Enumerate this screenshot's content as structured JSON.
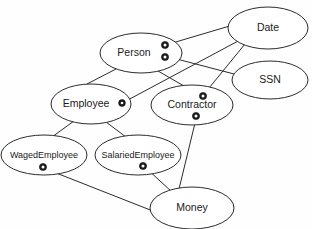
{
  "diagram": {
    "type": "uml-ellipse-graph",
    "background_color": "#fefefe",
    "stroke_color": "#2b2b2b",
    "label_color": "#1a1a1a",
    "marker_fill": "#1c1c1c",
    "marker_hole": "#fdfdfd",
    "nodes": [
      {
        "id": "person",
        "label": "Person",
        "cx": 141,
        "cy": 53,
        "rx": 41,
        "ry": 20,
        "font_size": 10.5,
        "label_dx": -7
      },
      {
        "id": "date",
        "label": "Date",
        "cx": 268,
        "cy": 28,
        "rx": 40,
        "ry": 21,
        "font_size": 10.5,
        "label_dx": 0
      },
      {
        "id": "ssn",
        "label": "SSN",
        "cx": 270,
        "cy": 80,
        "rx": 38,
        "ry": 19,
        "font_size": 10.5,
        "label_dx": 0
      },
      {
        "id": "employee",
        "label": "Employee",
        "cx": 91,
        "cy": 104,
        "rx": 40,
        "ry": 20,
        "font_size": 10.5,
        "label_dx": -5
      },
      {
        "id": "contractor",
        "label": "Contractor",
        "cx": 192,
        "cy": 105,
        "rx": 41,
        "ry": 20,
        "font_size": 10.5,
        "label_dx": 0
      },
      {
        "id": "wagedemployee",
        "label": "WagedEmployee",
        "cx": 44,
        "cy": 155,
        "rx": 43,
        "ry": 20,
        "font_size": 9,
        "label_dx": 0
      },
      {
        "id": "salariedemployee",
        "label": "SalariedEmployee",
        "cx": 138,
        "cy": 155,
        "rx": 43,
        "ry": 20,
        "font_size": 9,
        "label_dx": 0
      },
      {
        "id": "money",
        "label": "Money",
        "cx": 192,
        "cy": 208,
        "rx": 42,
        "ry": 21,
        "font_size": 10.5,
        "label_dx": 0
      }
    ],
    "markers": [
      {
        "id": "marker-person-upper",
        "owner": "person",
        "cx": 165,
        "cy": 45,
        "r": 3.6
      },
      {
        "id": "marker-person-lower",
        "owner": "person",
        "cx": 165,
        "cy": 57,
        "r": 3.6
      },
      {
        "id": "marker-employee-right",
        "owner": "employee",
        "cx": 122,
        "cy": 103,
        "r": 3.4
      },
      {
        "id": "marker-contractor-top",
        "owner": "contractor",
        "cx": 203,
        "cy": 96,
        "r": 3.6
      },
      {
        "id": "marker-contractor-bottom",
        "owner": "contractor",
        "cx": 196,
        "cy": 116,
        "r": 3.6
      },
      {
        "id": "marker-wagedemployee-bottom",
        "owner": "wagedemployee",
        "cx": 43,
        "cy": 167,
        "r": 3.6
      },
      {
        "id": "marker-salariedemployee-bottom",
        "owner": "salariedemployee",
        "cx": 143,
        "cy": 166,
        "r": 3.6
      }
    ],
    "edges": [
      {
        "id": "edge-person-date",
        "from": "person",
        "to": "date",
        "x1": 169,
        "y1": 44,
        "x2": 233,
        "y2": 25
      },
      {
        "id": "edge-person-ssn",
        "from": "person",
        "to": "ssn",
        "x1": 169,
        "y1": 57,
        "x2": 234,
        "y2": 74
      },
      {
        "id": "edge-person-employee",
        "from": "person",
        "to": "employee",
        "x1": 116,
        "y1": 69,
        "x2": 87,
        "y2": 84
      },
      {
        "id": "edge-person-contractor",
        "from": "person",
        "to": "contractor",
        "x1": 158,
        "y1": 71,
        "x2": 184,
        "y2": 86
      },
      {
        "id": "edge-employee-date",
        "from": "employee",
        "to": "date",
        "x1": 126,
        "y1": 101,
        "x2": 240,
        "y2": 40
      },
      {
        "id": "edge-date-contractor",
        "from": "date",
        "to": "contractor",
        "x1": 245,
        "y1": 44,
        "x2": 205,
        "y2": 93
      },
      {
        "id": "edge-employee-wagedemployee",
        "from": "employee",
        "to": "wagedemployee",
        "x1": 74,
        "y1": 121,
        "x2": 52,
        "y2": 137
      },
      {
        "id": "edge-employee-salariedemployee",
        "from": "employee",
        "to": "salariedemployee",
        "x1": 106,
        "y1": 122,
        "x2": 126,
        "y2": 137
      },
      {
        "id": "edge-wagedemployee-money",
        "from": "wagedemployee",
        "to": "money",
        "x1": 46,
        "y1": 169,
        "x2": 163,
        "y2": 215
      },
      {
        "id": "edge-salariedemployee-money",
        "from": "salariedemployee",
        "to": "money",
        "x1": 146,
        "y1": 168,
        "x2": 172,
        "y2": 192
      },
      {
        "id": "edge-contractor-money",
        "from": "contractor",
        "to": "money",
        "x1": 196,
        "y1": 119,
        "x2": 179,
        "y2": 189
      }
    ]
  }
}
